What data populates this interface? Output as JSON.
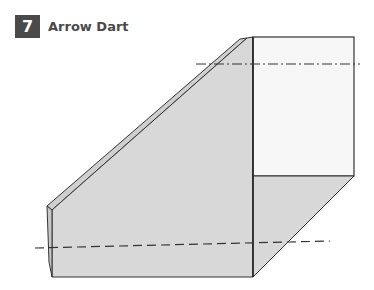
{
  "step": {
    "number": "7",
    "title": "Arrow Dart"
  },
  "colors": {
    "badge_bg": "#4a4a4a",
    "paper_shaded": "#d6d6d6",
    "paper_white": "#f7f7f7",
    "outline": "#333333"
  },
  "lines": {
    "mountain_fold": "dash-dot",
    "valley_fold": "dashed"
  }
}
